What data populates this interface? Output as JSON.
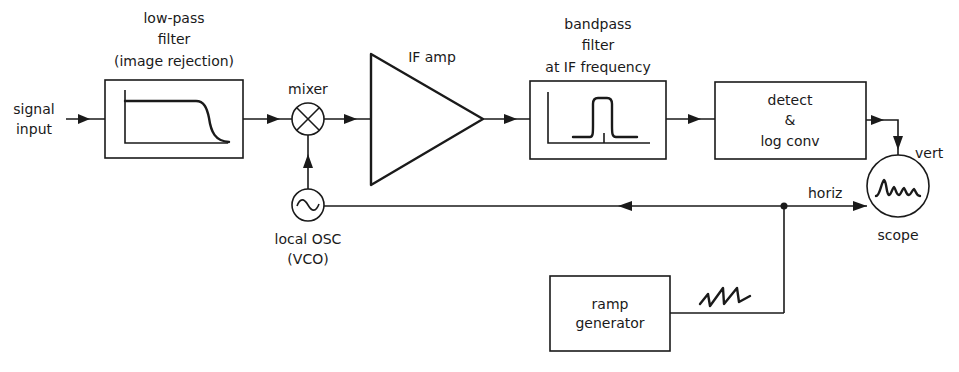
{
  "diagram": {
    "input_label_1": "signal",
    "input_label_2": "input",
    "lowpass": {
      "line1": "low-pass",
      "line2": "filter",
      "line3": "(image rejection)"
    },
    "mixer": {
      "label": "mixer"
    },
    "local_osc": {
      "line1": "local OSC",
      "line2": "(VCO)"
    },
    "if_amp": {
      "label": "IF amp"
    },
    "bandpass": {
      "line1": "bandpass",
      "line2": "filter",
      "line3": "at IF frequency"
    },
    "detector": {
      "line1": "detect",
      "line2": "&",
      "line3": "log conv"
    },
    "scope": {
      "label": "scope",
      "vert_label": "vert",
      "horiz_label": "horiz"
    },
    "ramp": {
      "line1": "ramp",
      "line2": "generator"
    }
  }
}
